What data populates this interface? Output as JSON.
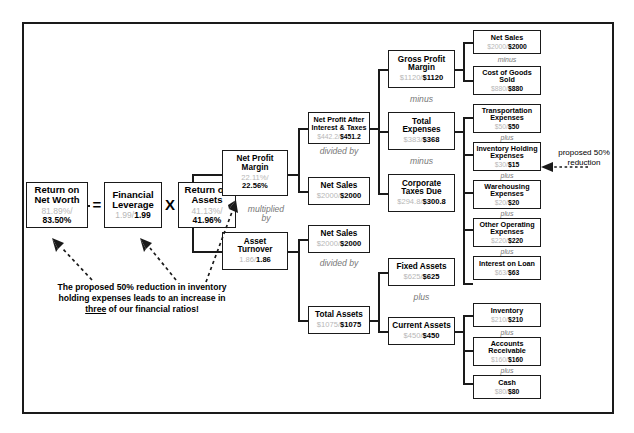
{
  "diagram": {
    "frame_color": "#1a1a1a",
    "old_value_color": "#b7b7b7",
    "new_value_color": "#000000"
  },
  "operators": {
    "equals": "=",
    "times": "X"
  },
  "connectives": {
    "multiplied_by": "multiplied\nby",
    "divided_by": "divided by",
    "minus": "minus",
    "plus": "plus"
  },
  "annotation": {
    "caption_line1": "The proposed 50% reduction in inventory",
    "caption_line2": "holding expenses leads to an increase in",
    "caption_line3_pre": "",
    "caption_line3_underline": "three",
    "caption_line3_post": " of our financial ratios!",
    "proposed_label": "proposed 50%\nreduction"
  },
  "nodes": {
    "return_on_net_worth": {
      "title": "Return on\nNet Worth",
      "old": "81.89%",
      "sep": "/",
      "new": "83.50%"
    },
    "financial_leverage": {
      "title": "Financial\nLeverage",
      "old": "1.99",
      "sep": "/",
      "new": "1.99"
    },
    "return_on_assets": {
      "title": "Return on\nAssets",
      "old": "41.13%",
      "sep": "/",
      "new": "41.96%"
    },
    "net_profit_margin": {
      "title": "Net Profit\nMargin",
      "old": "22.11%",
      "sep": "/",
      "new": "22.56%"
    },
    "asset_turnover": {
      "title": "Asset\nTurnover",
      "old": "1.86",
      "sep": "/",
      "new": "1.86"
    },
    "net_profit_after_interest_taxes": {
      "title": "Net Profit After\nInterest & Taxes",
      "old": "$442.2",
      "sep": "/",
      "new": "$451.2"
    },
    "net_sales_npm": {
      "title": "Net Sales",
      "old": "$2000",
      "sep": "/",
      "new": "$2000"
    },
    "net_sales_at": {
      "title": "Net Sales",
      "old": "$2000",
      "sep": "/",
      "new": "$2000"
    },
    "total_assets": {
      "title": "Total Assets",
      "old": "$1075",
      "sep": "/",
      "new": "$1075"
    },
    "gross_profit_margin": {
      "title": "Gross Profit\nMargin",
      "old": "$1120",
      "sep": "/",
      "new": "$1120"
    },
    "total_expenses": {
      "title": "Total\nExpenses",
      "old": "$383",
      "sep": "/",
      "new": "$368"
    },
    "corporate_taxes_due": {
      "title": "Corporate\nTaxes Due",
      "old": "$294.8",
      "sep": "/",
      "new": "$300.8"
    },
    "fixed_assets": {
      "title": "Fixed Assets",
      "old": "$625",
      "sep": "/",
      "new": "$625"
    },
    "current_assets": {
      "title": "Current Assets",
      "old": "$450",
      "sep": "/",
      "new": "$450"
    },
    "net_sales_gpm": {
      "title": "Net Sales",
      "old": "$2000",
      "sep": "/",
      "new": "$2000"
    },
    "cost_of_goods_sold": {
      "title": "Cost of Goods\nSold",
      "old": "$880",
      "sep": "/",
      "new": "$880"
    },
    "transportation_expenses": {
      "title": "Transportation\nExpenses",
      "old": "$50",
      "sep": "/",
      "new": "$50"
    },
    "inventory_holding_expenses": {
      "title": "Inventory Holding\nExpenses",
      "old": "$30",
      "sep": "/",
      "new": "$15"
    },
    "warehousing_expenses": {
      "title": "Warehousing\nExpenses",
      "old": "$20",
      "sep": "/",
      "new": "$20"
    },
    "other_operating_expenses": {
      "title": "Other Operating\nExpenses",
      "old": "$220",
      "sep": "/",
      "new": "$220"
    },
    "interest_on_loan": {
      "title": "Interest on Loan",
      "old": "$63",
      "sep": "/",
      "new": "$63"
    },
    "inventory": {
      "title": "Inventory",
      "old": "$210",
      "sep": "/",
      "new": "$210"
    },
    "accounts_receivable": {
      "title": "Accounts\nReceivable",
      "old": "$160",
      "sep": "/",
      "new": "$160"
    },
    "cash": {
      "title": "Cash",
      "old": "$80",
      "sep": "/",
      "new": "$80"
    }
  }
}
